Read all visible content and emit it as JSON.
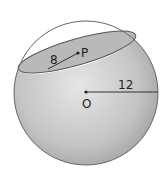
{
  "diagram": {
    "type": "sphere-cross-section",
    "labels": {
      "center_point": "O",
      "section_center": "P",
      "section_radius": "8",
      "sphere_radius": "12"
    },
    "colors": {
      "outline": "#555555",
      "fill_light": "#e4e4e4",
      "fill_dark": "#a9a9a9",
      "section_fill": "#b8b8b8",
      "background": "#ffffff"
    }
  }
}
